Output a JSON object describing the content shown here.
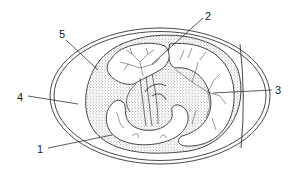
{
  "diagram": {
    "type": "labeled anatomical diagram",
    "stroke_color": "#333333",
    "background": "#ffffff",
    "labels": [
      {
        "id": "1",
        "text": "1",
        "x": 37,
        "y": 144,
        "target": "embryo"
      },
      {
        "id": "2",
        "text": "2",
        "x": 205,
        "y": 11,
        "target": "upper vascular sac"
      },
      {
        "id": "3",
        "text": "3",
        "x": 275,
        "y": 85,
        "target": "right vascular sac"
      },
      {
        "id": "4",
        "text": "4",
        "x": 17,
        "y": 92,
        "target": "albumen space"
      },
      {
        "id": "5",
        "text": "5",
        "x": 59,
        "y": 29,
        "target": "stippled layer"
      }
    ]
  }
}
